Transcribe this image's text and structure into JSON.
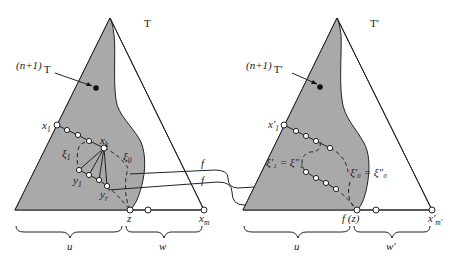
{
  "figure": {
    "left_tree": {
      "title": "T",
      "subtree_label_prefix": "(n+1)",
      "subtree_label_suffix": "T",
      "node_labels": {
        "x1": "x",
        "x1_sub": "1",
        "xk": "x",
        "xk_sub": "k",
        "xi1": "ξ",
        "xi1_sub": "1",
        "xi0": "ξ",
        "xi0_sub": "0",
        "y1": "y",
        "y1_sub": "1",
        "yr": "y",
        "yr_sub": "r",
        "z": "z",
        "xm": "x",
        "xm_sub": "m"
      },
      "brace_labels": {
        "u": "u",
        "w": "w"
      }
    },
    "right_tree": {
      "title": "T′",
      "subtree_label_prefix": "(n+1)",
      "subtree_label_suffix": "T′",
      "node_labels": {
        "x1": "x′",
        "x1_sub": "1",
        "xi1_eq": "ξ′₁ = ξ″₁",
        "xi0_eq": "ξ′₀ = ξ″₀",
        "fz": "f (z)",
        "xm": "x′",
        "xm_sub": "m′"
      },
      "brace_labels": {
        "u": "u",
        "w": "w′"
      }
    },
    "mapping_labels": [
      "f",
      "f"
    ],
    "colors": {
      "shaded_region": "#a9a9a9",
      "ink": "#222222",
      "background": "#ffffff"
    }
  }
}
